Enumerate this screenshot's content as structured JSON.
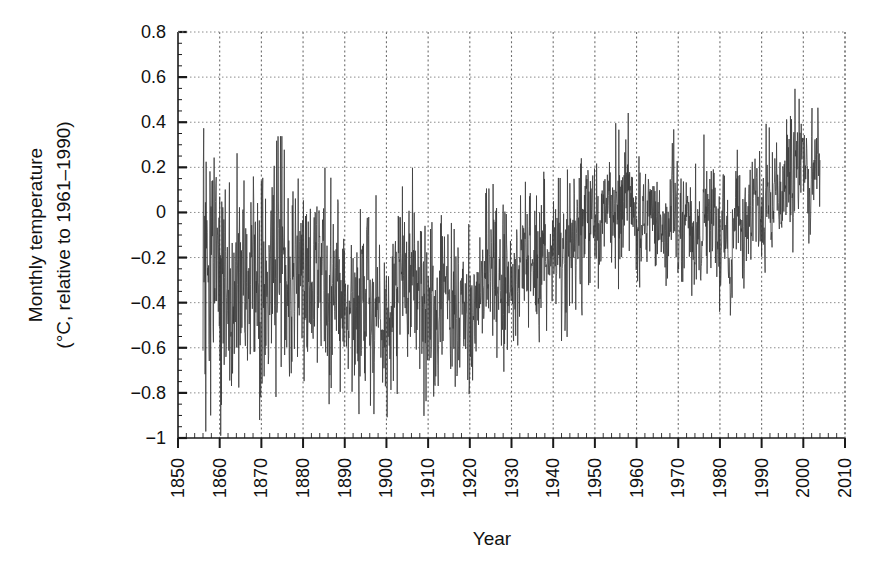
{
  "chart_data": {
    "type": "line",
    "title": "",
    "subtitle": "",
    "xlabel": "Year",
    "ylabel_line1": "Monthly temperature",
    "ylabel_line2": "(°C, relative to 1961–1990)",
    "xlim": [
      1850,
      2010
    ],
    "ylim": [
      -1,
      0.8
    ],
    "xticks": [
      1850,
      1860,
      1870,
      1880,
      1890,
      1900,
      1910,
      1920,
      1930,
      1940,
      1950,
      1960,
      1970,
      1980,
      1990,
      2000,
      2010
    ],
    "xtick_labels": [
      "1850",
      "1860",
      "1870",
      "1880",
      "1890",
      "1900",
      "1910",
      "1920",
      "1930",
      "1940",
      "1950",
      "1960",
      "1970",
      "1980",
      "1990",
      "2000",
      "2010"
    ],
    "yticks": [
      -1,
      -0.8,
      -0.6,
      -0.4,
      -0.2,
      0,
      0.2,
      0.4,
      0.6,
      0.8
    ],
    "ytick_labels": [
      "−1",
      "−0.8",
      "−0.6",
      "−0.4",
      "−0.2",
      "0",
      "0.2",
      "0.4",
      "0.6",
      "0.8"
    ],
    "grid": true,
    "grid_style": "dotted",
    "legend": null,
    "line_color": "#3a3a3a",
    "line_width": 0.8,
    "data_start_year": 1856.0,
    "data_end_year": 2004.0,
    "samples_per_year": 12,
    "series": [
      {
        "name": "Global monthly temperature anomaly",
        "annual_mean": [
          -0.33,
          -0.4,
          -0.4,
          -0.34,
          -0.34,
          -0.34,
          -0.42,
          -0.38,
          -0.32,
          -0.28,
          -0.29,
          -0.32,
          -0.29,
          -0.27,
          -0.28,
          -0.33,
          -0.26,
          -0.22,
          -0.26,
          -0.32,
          -0.32,
          -0.36,
          -0.27,
          -0.29,
          -0.28,
          -0.33,
          -0.34,
          -0.12,
          -0.2,
          -0.34,
          -0.33,
          -0.3,
          -0.33,
          -0.39,
          -0.44,
          -0.44,
          -0.42,
          -0.47,
          -0.37,
          -0.25,
          -0.44,
          -0.4,
          -0.47,
          -0.47,
          -0.44,
          -0.38,
          -0.35,
          -0.26,
          -0.33,
          -0.34,
          -0.27,
          -0.33,
          -0.39,
          -0.46,
          -0.43,
          -0.52,
          -0.49,
          -0.38,
          -0.33,
          -0.37,
          -0.41,
          -0.47,
          -0.44,
          -0.48,
          -0.44,
          -0.43,
          -0.36,
          -0.33,
          -0.31,
          -0.29,
          -0.3,
          -0.3,
          -0.29,
          -0.23,
          -0.28,
          -0.29,
          -0.21,
          -0.26,
          -0.25,
          -0.23,
          -0.26,
          -0.18,
          -0.2,
          -0.16,
          -0.15,
          -0.12,
          -0.18,
          -0.2,
          -0.1,
          -0.13,
          -0.15,
          -0.05,
          -0.03,
          -0.06,
          -0.05,
          0.01,
          0.04,
          0.06,
          -0.02,
          0.05,
          0.02,
          0.1,
          0.07,
          -0.02,
          -0.01,
          -0.07,
          -0.06,
          0.04,
          0.01,
          -0.06,
          -0.03,
          -0.04,
          0.04,
          0.02,
          -0.08,
          -0.02,
          0.02,
          -0.08,
          -0.07,
          -0.13,
          -0.01,
          0.0,
          0.04,
          -0.09,
          -0.05,
          -0.02,
          -0.22,
          -0.07,
          0.0,
          -0.05,
          -0.05,
          0.02,
          0.07,
          0.04,
          -0.05,
          0.06,
          0.05,
          0.15,
          0.02,
          0.1,
          0.15,
          0.12,
          0.21,
          0.29,
          0.18,
          0.11,
          0.2,
          0.27,
          0.26,
          0.24,
          0.32,
          0.46,
          0.27,
          0.41,
          0.42,
          0.54,
          0.48,
          0.45,
          0.43
        ],
        "annual_spread": [
          0.33,
          0.34,
          0.32,
          0.3,
          0.29,
          0.28,
          0.28,
          0.27,
          0.26,
          0.26,
          0.26,
          0.25,
          0.25,
          0.25,
          0.24,
          0.24,
          0.24,
          0.23,
          0.23,
          0.23,
          0.22,
          0.22,
          0.22,
          0.22,
          0.22,
          0.21,
          0.21,
          0.21,
          0.21,
          0.21,
          0.2,
          0.2,
          0.2,
          0.2,
          0.2,
          0.2,
          0.2,
          0.19,
          0.19,
          0.19,
          0.19,
          0.19,
          0.19,
          0.19,
          0.18,
          0.18,
          0.18,
          0.18,
          0.18,
          0.18,
          0.18,
          0.18,
          0.18,
          0.17,
          0.17,
          0.17,
          0.17,
          0.17,
          0.17,
          0.17,
          0.17,
          0.17,
          0.17,
          0.17,
          0.16,
          0.16,
          0.16,
          0.16,
          0.16,
          0.16,
          0.16,
          0.16,
          0.16,
          0.16,
          0.16,
          0.16,
          0.16,
          0.16,
          0.16,
          0.15,
          0.15,
          0.15,
          0.15,
          0.15,
          0.15,
          0.15,
          0.15,
          0.15,
          0.15,
          0.15,
          0.15,
          0.15,
          0.15,
          0.15,
          0.15,
          0.15,
          0.15,
          0.15,
          0.15,
          0.15,
          0.15,
          0.15,
          0.15,
          0.14,
          0.14,
          0.14,
          0.14,
          0.14,
          0.14,
          0.14,
          0.14,
          0.14,
          0.14,
          0.14,
          0.14,
          0.14,
          0.14,
          0.14,
          0.14,
          0.14,
          0.14,
          0.14,
          0.14,
          0.14,
          0.14,
          0.13,
          0.13,
          0.13,
          0.13,
          0.13,
          0.13,
          0.13,
          0.13,
          0.13,
          0.13,
          0.13,
          0.13,
          0.13,
          0.13,
          0.13,
          0.13,
          0.13,
          0.13,
          0.13,
          0.13,
          0.13,
          0.13,
          0.13,
          0.13,
          0.13,
          0.13,
          0.14,
          0.13,
          0.13,
          0.13,
          0.14,
          0.13,
          0.13,
          0.12
        ]
      }
    ]
  },
  "layout": {
    "plot_left": 178,
    "plot_right": 845,
    "plot_top": 32,
    "plot_bottom": 438
  }
}
